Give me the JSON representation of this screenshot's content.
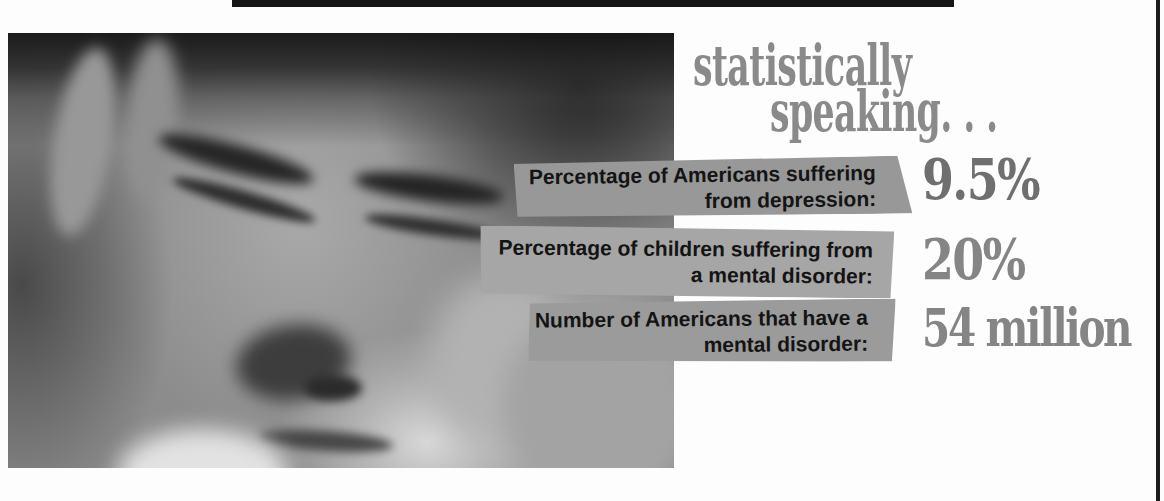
{
  "page": {
    "background_color": "#ffffff",
    "top_strip_color": "#161616",
    "right_border_color": "#1c1c1c"
  },
  "title": {
    "line1": "statistically",
    "line2": "speaking. . .",
    "color": "#8a8a8a"
  },
  "photo": {
    "description": "grayscale photo of a young person looking down, resting face in hands"
  },
  "stats": [
    {
      "label_line1": "Percentage of Americans suffering",
      "label_line2": "from depression:",
      "value": "9.5%",
      "banner_color": "#989898",
      "value_color": "#6f6f6f"
    },
    {
      "label_line1": "Percentage of children suffering from",
      "label_line2": "a mental disorder:",
      "value": "20%",
      "banner_color": "#a6a6a6",
      "value_color": "#858585"
    },
    {
      "label_line1": "Number of Americans that have a",
      "label_line2": "mental disorder:",
      "value": "54 million",
      "banner_color": "#9b9b9b",
      "value_color": "#858585"
    }
  ],
  "label_text_color": "#141414"
}
